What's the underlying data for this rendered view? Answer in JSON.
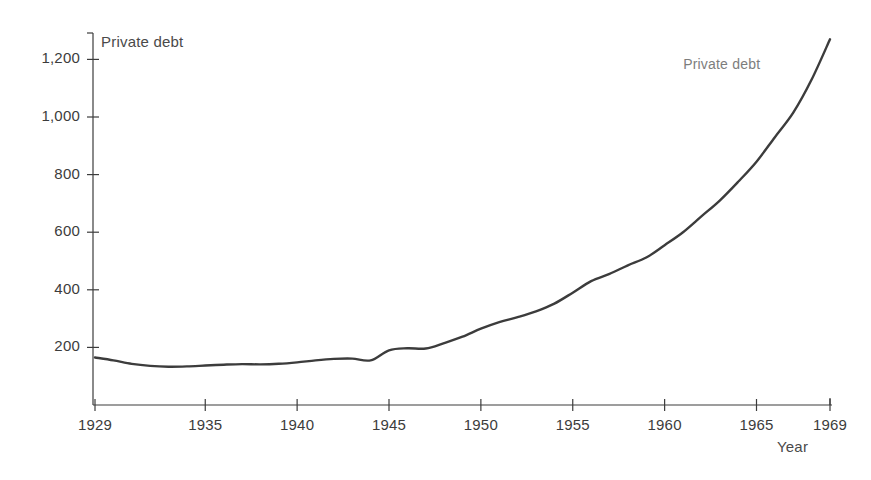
{
  "chart_data": {
    "type": "line",
    "title": "",
    "subtitle": "",
    "xlabel": "Year",
    "ylabel": "Private debt",
    "y_axis_caption": "Private debt",
    "x_axis_caption": "Year",
    "grid": false,
    "legend_position": "inline-annotation",
    "annotations": [
      {
        "text": "Private debt",
        "x": 1964.0,
        "y": 1180
      }
    ],
    "xlim": [
      1929,
      1969
    ],
    "ylim": [
      0,
      1300
    ],
    "xticks": [
      1929,
      1935,
      1940,
      1945,
      1950,
      1955,
      1960,
      1965,
      1969
    ],
    "xtick_labels": [
      "1929",
      "1935",
      "1940",
      "1945",
      "1950",
      "1955",
      "1960",
      "1965",
      "1969"
    ],
    "yticks": [
      200,
      400,
      600,
      800,
      1000,
      1200
    ],
    "ytick_labels": [
      "200",
      "400",
      "600",
      "800",
      "1,000",
      "1,200"
    ],
    "series": [
      {
        "name": "Private debt",
        "color": "#3c3c3c",
        "x": [
          1929,
          1930,
          1931,
          1932,
          1933,
          1934,
          1935,
          1936,
          1937,
          1938,
          1939,
          1940,
          1941,
          1942,
          1943,
          1944,
          1945,
          1946,
          1947,
          1948,
          1949,
          1950,
          1951,
          1952,
          1953,
          1954,
          1955,
          1956,
          1957,
          1958,
          1959,
          1960,
          1961,
          1962,
          1963,
          1964,
          1965,
          1966,
          1967,
          1968,
          1969
        ],
        "values": [
          165,
          155,
          143,
          136,
          133,
          134,
          137,
          140,
          142,
          141,
          143,
          148,
          155,
          160,
          161,
          155,
          190,
          197,
          196,
          215,
          237,
          265,
          288,
          305,
          325,
          352,
          390,
          430,
          455,
          485,
          512,
          555,
          600,
          655,
          710,
          775,
          845,
          930,
          1015,
          1130,
          1270
        ],
        "units": "billions of dollars"
      }
    ]
  },
  "axes": {
    "y_caption": "Private debt",
    "x_caption": "Year"
  }
}
